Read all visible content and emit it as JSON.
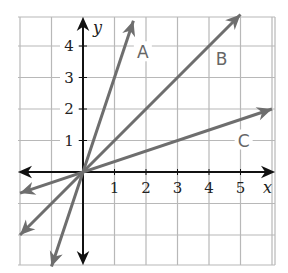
{
  "chart_data": {
    "type": "line",
    "title": "",
    "xlabel": "x",
    "ylabel": "y",
    "xlim": [
      -2,
      6
    ],
    "ylim": [
      -3,
      5
    ],
    "grid": true,
    "x_ticks": [
      1,
      2,
      3,
      4,
      5
    ],
    "y_ticks": [
      1,
      2,
      3,
      4
    ],
    "series": [
      {
        "name": "A",
        "equation": "y = 3x",
        "slope": 3,
        "x": [
          -1,
          1.6
        ],
        "y": [
          -3,
          4.8
        ]
      },
      {
        "name": "B",
        "equation": "y = x",
        "slope": 1,
        "x": [
          -2,
          5
        ],
        "y": [
          -2,
          5
        ]
      },
      {
        "name": "C",
        "equation": "y = x/3",
        "slope": 0.333,
        "x": [
          -2,
          6
        ],
        "y": [
          -0.67,
          2
        ]
      }
    ],
    "annotations": [
      {
        "text": "A",
        "x": 1.9,
        "y": 3.8
      },
      {
        "text": "B",
        "x": 4.4,
        "y": 3.6
      },
      {
        "text": "C",
        "x": 5.1,
        "y": 1.0
      }
    ]
  },
  "colors": {
    "grid": "#b8b8b8",
    "axis": "#111111",
    "lines": "#6e6e6e"
  }
}
